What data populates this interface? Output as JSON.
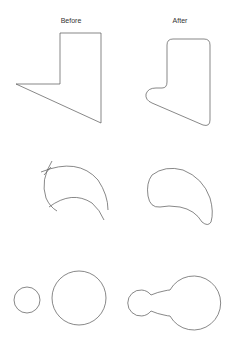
{
  "columns": {
    "before_label": "Before",
    "after_label": "After"
  },
  "colors": {
    "stroke": "#555555",
    "text": "#333333",
    "background": "#ffffff"
  },
  "rows": [
    {
      "name": "polygon-fillet",
      "before": "sharp L-shaped polygon",
      "after": "rounded L-shaped polygon"
    },
    {
      "name": "curve-join",
      "before": "intersecting open arcs",
      "after": "closed smooth crescent outline"
    },
    {
      "name": "circle-blend",
      "before": "two separate circles",
      "after": "two circles joined by a concave fillet bridge"
    }
  ]
}
